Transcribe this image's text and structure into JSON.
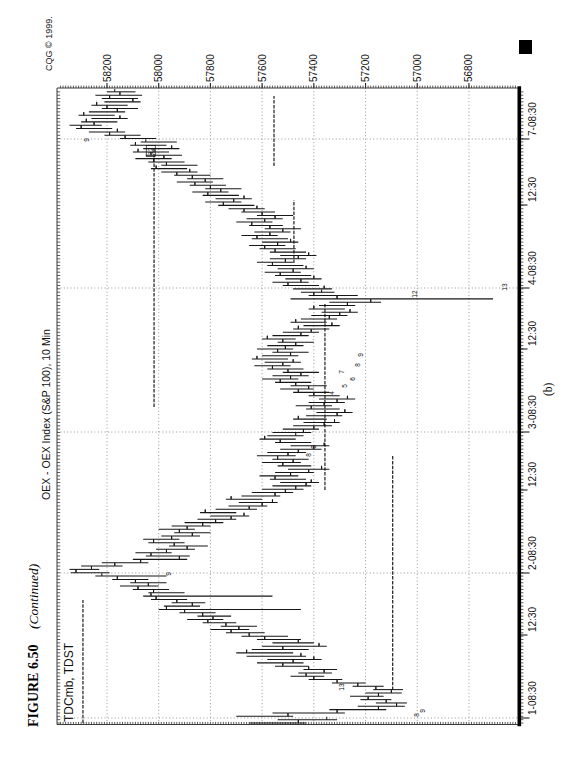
{
  "page": {
    "figure_caption_bold": "FIGURE 6.50",
    "figure_caption_italic": "(Continued)",
    "subfigure_label": "(b)",
    "vendor_credit": "CQG © 1999."
  },
  "colors": {
    "ink": "#171717",
    "grid": "#8c8c8c",
    "paper": "#ffffff"
  },
  "chart_data": {
    "type": "bar",
    "subtype": "ohlc-10min-bars",
    "title": "OEX - OEX Index (S&P 100), 10 Min",
    "studies_label": "TDCmb, TDST",
    "xlabel": "",
    "ylabel": "",
    "grid": "dotted",
    "orientation": "rotated-90-ccw-on-page",
    "price_axis": {
      "tick_values": [
        58200,
        58000,
        57800,
        57600,
        57400,
        57200,
        57000,
        56800
      ],
      "range": [
        56610,
        58390
      ],
      "minor_tick_step": 10
    },
    "time_axis": {
      "ticks": [
        {
          "label": "1-08:30",
          "pos": 55,
          "session": true
        },
        {
          "label": "12:30",
          "pos": 138,
          "session": false
        },
        {
          "label": "2-08:30",
          "pos": 200,
          "session": true
        },
        {
          "label": "12:30",
          "pos": 283,
          "session": false
        },
        {
          "label": "3-08:30",
          "pos": 341,
          "session": true
        },
        {
          "label": "12:30",
          "pos": 424,
          "session": false
        },
        {
          "label": "4-08:30",
          "pos": 485,
          "session": true
        },
        {
          "label": "12:30",
          "pos": 568,
          "session": false
        },
        {
          "label": "7-08:30",
          "pos": 634,
          "session": true
        }
      ]
    },
    "days": [
      {
        "session": "day-0-pm",
        "bars": [
          [
            57650,
            57430,
            57460
          ],
          [
            57540,
            57310,
            57350
          ]
        ]
      },
      {
        "session": "day-1",
        "bars": [
          [
            57700,
            57480,
            57500
          ],
          [
            57560,
            57280,
            57310
          ],
          [
            57340,
            57120,
            57150
          ],
          [
            57230,
            57048,
            57080
          ],
          [
            57160,
            57040,
            57120
          ],
          [
            57220,
            57100,
            57190
          ],
          [
            57260,
            57130,
            57150
          ],
          [
            57200,
            57060,
            57100
          ],
          [
            57170,
            57055,
            57160
          ],
          [
            57250,
            57130,
            57230
          ],
          [
            57330,
            57200,
            57310
          ],
          [
            57420,
            57290,
            57400
          ],
          [
            57490,
            57360,
            57430
          ],
          [
            57460,
            57330,
            57360
          ],
          [
            57440,
            57310,
            57420
          ],
          [
            57550,
            57420,
            57520
          ],
          [
            57620,
            57440,
            57480
          ],
          [
            57580,
            57370,
            57400
          ],
          [
            57660,
            57430,
            57450
          ],
          [
            57700,
            57480,
            57660
          ],
          [
            57640,
            57420,
            57520
          ],
          [
            57600,
            57350,
            57380
          ],
          [
            57560,
            57400,
            57460
          ],
          [
            57620,
            57450,
            57590
          ],
          [
            57680,
            57500,
            57650
          ],
          [
            57740,
            57590,
            57720
          ],
          [
            57800,
            57650,
            57690
          ],
          [
            57760,
            57620,
            57740
          ],
          [
            57830,
            57700,
            57810
          ],
          [
            57890,
            57750,
            57790
          ],
          [
            57850,
            57720,
            57830
          ],
          [
            57920,
            57780,
            57900
          ],
          [
            58000,
            57450,
            57970
          ],
          [
            57980,
            57840,
            57870
          ],
          [
            57950,
            57820,
            57930
          ],
          [
            58030,
            57890,
            58010
          ],
          [
            58060,
            57560,
            58030
          ],
          [
            58040,
            57900,
            58020
          ],
          [
            58100,
            57960,
            58080
          ],
          [
            58150,
            58000,
            58040
          ],
          [
            58110,
            57970,
            58090
          ],
          [
            58180,
            58040,
            58160
          ],
          [
            58245,
            57970,
            58220
          ]
        ]
      },
      {
        "session": "day-2",
        "bars": [
          [
            58340,
            58190,
            58320
          ],
          [
            58345,
            58230,
            58260
          ],
          [
            58300,
            58140,
            58170
          ],
          [
            58220,
            58040,
            58070
          ],
          [
            58100,
            57890,
            57920
          ],
          [
            58050,
            57880,
            58030
          ],
          [
            58090,
            57950,
            57970
          ],
          [
            58010,
            57860,
            57890
          ],
          [
            57960,
            57810,
            57940
          ],
          [
            58040,
            57900,
            58020
          ],
          [
            58060,
            57920,
            57950
          ],
          [
            57990,
            57840,
            57870
          ],
          [
            57940,
            57800,
            57920
          ],
          [
            58000,
            57860,
            57890
          ],
          [
            57950,
            57800,
            57830
          ],
          [
            57900,
            57750,
            57780
          ],
          [
            57850,
            57700,
            57720
          ],
          [
            57800,
            57650,
            57670
          ],
          [
            57840,
            57700,
            57820
          ],
          [
            57780,
            57620,
            57650
          ],
          [
            57730,
            57580,
            57600
          ],
          [
            57690,
            57540,
            57560
          ],
          [
            57740,
            57600,
            57720
          ],
          [
            57680,
            57530,
            57550
          ],
          [
            57640,
            57480,
            57510
          ],
          [
            57600,
            57440,
            57470
          ],
          [
            57560,
            57410,
            57430
          ],
          [
            57530,
            57380,
            57410
          ],
          [
            57570,
            57430,
            57550
          ],
          [
            57610,
            57460,
            57490
          ],
          [
            57550,
            57400,
            57420
          ],
          [
            57500,
            57340,
            57370
          ],
          [
            57540,
            57410,
            57520
          ],
          [
            57600,
            57450,
            57480
          ],
          [
            57560,
            57420,
            57540
          ],
          [
            57620,
            57470,
            57500
          ],
          [
            57580,
            57430,
            57460
          ],
          [
            57530,
            57370,
            57400
          ],
          [
            57490,
            57340,
            57360
          ],
          [
            57550,
            57410,
            57530
          ],
          [
            57610,
            57470,
            57590
          ],
          [
            57580,
            57440,
            57470
          ]
        ]
      },
      {
        "session": "day-3",
        "bars": [
          [
            57560,
            57410,
            57440
          ],
          [
            57520,
            57380,
            57400
          ],
          [
            57480,
            57330,
            57360
          ],
          [
            57440,
            57300,
            57320
          ],
          [
            57480,
            57350,
            57460
          ],
          [
            57430,
            57290,
            57310
          ],
          [
            57390,
            57250,
            57280
          ],
          [
            57430,
            57300,
            57410
          ],
          [
            57470,
            57330,
            57360
          ],
          [
            57420,
            57280,
            57310
          ],
          [
            57380,
            57240,
            57270
          ],
          [
            57420,
            57300,
            57400
          ],
          [
            57480,
            57340,
            57460
          ],
          [
            57530,
            57400,
            57420
          ],
          [
            57490,
            57350,
            57470
          ],
          [
            57550,
            57410,
            57530
          ],
          [
            57600,
            57460,
            57490
          ],
          [
            57560,
            57420,
            57450
          ],
          [
            57520,
            57380,
            57500
          ],
          [
            57580,
            57440,
            57560
          ],
          [
            57630,
            57490,
            57520
          ],
          [
            57590,
            57450,
            57480
          ],
          [
            57640,
            57500,
            57620
          ],
          [
            57600,
            57460,
            57490
          ],
          [
            57560,
            57420,
            57540
          ],
          [
            57620,
            57480,
            57510
          ],
          [
            57580,
            57440,
            57470
          ],
          [
            57540,
            57400,
            57520
          ],
          [
            57600,
            57470,
            57580
          ],
          [
            57560,
            57420,
            57450
          ],
          [
            57520,
            57380,
            57410
          ],
          [
            57480,
            57340,
            57460
          ],
          [
            57440,
            57300,
            57330
          ],
          [
            57490,
            57350,
            57470
          ],
          [
            57450,
            57310,
            57340
          ],
          [
            57410,
            57270,
            57300
          ],
          [
            57370,
            57230,
            57260
          ],
          [
            57420,
            57280,
            57400
          ],
          [
            57380,
            57240,
            57270
          ],
          [
            57340,
            57140,
            57180
          ],
          [
            57490,
            56707,
            57310
          ],
          [
            57420,
            57230,
            57400
          ],
          [
            57450,
            57320,
            57370
          ]
        ]
      },
      {
        "session": "day-4",
        "bars": [
          [
            57480,
            57330,
            57360
          ],
          [
            57520,
            57380,
            57500
          ],
          [
            57560,
            57420,
            57450
          ],
          [
            57510,
            57370,
            57400
          ],
          [
            57550,
            57410,
            57530
          ],
          [
            57590,
            57450,
            57480
          ],
          [
            57540,
            57400,
            57430
          ],
          [
            57580,
            57440,
            57560
          ],
          [
            57620,
            57480,
            57510
          ],
          [
            57570,
            57430,
            57460
          ],
          [
            57530,
            57390,
            57420
          ],
          [
            57570,
            57430,
            57550
          ],
          [
            57610,
            57470,
            57590
          ],
          [
            57650,
            57510,
            57540
          ],
          [
            57600,
            57460,
            57490
          ],
          [
            57640,
            57500,
            57620
          ],
          [
            57680,
            57540,
            57570
          ],
          [
            57630,
            57490,
            57520
          ],
          [
            57590,
            57450,
            57570
          ],
          [
            57650,
            57520,
            57640
          ],
          [
            57700,
            57560,
            57590
          ],
          [
            57660,
            57520,
            57550
          ],
          [
            57620,
            57480,
            57600
          ],
          [
            57680,
            57550,
            57670
          ],
          [
            57730,
            57590,
            57620
          ],
          [
            57770,
            57630,
            57750
          ],
          [
            57820,
            57680,
            57710
          ],
          [
            57780,
            57640,
            57670
          ],
          [
            57830,
            57690,
            57810
          ],
          [
            57870,
            57730,
            57760
          ],
          [
            57820,
            57680,
            57800
          ],
          [
            57880,
            57740,
            57860
          ],
          [
            57930,
            57790,
            57820
          ],
          [
            57890,
            57750,
            57870
          ],
          [
            57940,
            57800,
            57930
          ],
          [
            57990,
            57850,
            57880
          ],
          [
            58030,
            57890,
            58010
          ],
          [
            57990,
            57850,
            57970
          ],
          [
            58040,
            57900,
            58020
          ],
          [
            58090,
            57950,
            57980
          ],
          [
            58050,
            57910,
            58030
          ],
          [
            58100,
            57960,
            58080
          ],
          [
            58060,
            57920,
            57950
          ],
          [
            58110,
            57970,
            58090
          ],
          [
            58070,
            57930,
            58050
          ]
        ]
      },
      {
        "session": "day-7",
        "bars": [
          [
            58150,
            58010,
            58130
          ],
          [
            58210,
            58070,
            58190
          ],
          [
            58270,
            58130,
            58160
          ],
          [
            58320,
            58180,
            58300
          ],
          [
            58345,
            58220,
            58250
          ],
          [
            58300,
            58160,
            58280
          ],
          [
            58260,
            58120,
            58150
          ],
          [
            58310,
            58170,
            58290
          ],
          [
            58270,
            58130,
            58160
          ],
          [
            58220,
            58080,
            58200
          ],
          [
            58260,
            58120,
            58240
          ],
          [
            58210,
            58070,
            58100
          ],
          [
            58220,
            58080,
            58190
          ],
          [
            58245,
            58064,
            58150
          ],
          [
            58200,
            58090,
            58170
          ]
        ]
      }
    ],
    "tdst_lines": [
      {
        "price": 58293,
        "from": 50,
        "to": 173
      },
      {
        "price": 57095,
        "from": 83,
        "to": 318
      },
      {
        "price": 58018,
        "from": 366,
        "to": 625
      },
      {
        "price": 57357,
        "from": 283,
        "to": 470
      },
      {
        "price": 57477,
        "from": 510,
        "to": 573
      },
      {
        "price": 57554,
        "from": 607,
        "to": 677
      }
    ],
    "annotations": [
      {
        "pos": 58,
        "price": 57000,
        "text": "8"
      },
      {
        "pos": 62,
        "price": 56980,
        "text": "9"
      },
      {
        "pos": 86,
        "price": 57290,
        "text": "13"
      },
      {
        "pos": 199,
        "price": 57960,
        "text": "9"
      },
      {
        "pos": 318,
        "price": 57420,
        "text": "8"
      },
      {
        "pos": 326,
        "price": 57400,
        "text": "9"
      },
      {
        "pos": 380,
        "price": 57330,
        "text": "4"
      },
      {
        "pos": 387,
        "price": 57280,
        "text": "5"
      },
      {
        "pos": 394,
        "price": 57250,
        "text": "6"
      },
      {
        "pos": 401,
        "price": 57290,
        "text": "7"
      },
      {
        "pos": 408,
        "price": 57230,
        "text": "8"
      },
      {
        "pos": 418,
        "price": 57220,
        "text": "9"
      },
      {
        "pos": 479,
        "price": 57010,
        "text": "12"
      },
      {
        "pos": 486,
        "price": 56660,
        "text": "13"
      },
      {
        "pos": 622,
        "price": 58030,
        "text": "12",
        "boxed": true
      },
      {
        "pos": 633,
        "price": 58280,
        "text": "9"
      }
    ]
  }
}
